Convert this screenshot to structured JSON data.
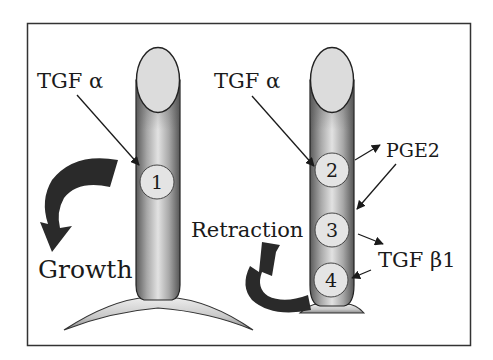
{
  "figure": {
    "left_panel": {
      "signal_label": "TGF α",
      "process_label": "Growth",
      "sites": [
        {
          "number": "1"
        }
      ]
    },
    "right_panel": {
      "signal_label": "TGF α",
      "process_label": "Retraction",
      "sites": [
        {
          "number": "2"
        },
        {
          "number": "3"
        },
        {
          "number": "4"
        }
      ],
      "secreted_labels": {
        "pge2": "PGE2",
        "tgf_beta1": "TGF β1"
      }
    },
    "colors": {
      "frame": "#333333",
      "tube_edge": "#5a5a5a",
      "tube_mid": "#d8d8d8",
      "cap_fill": "#dcdcdc",
      "arrow_fill": "#2a2a2a",
      "text": "#1a1a1a"
    }
  }
}
